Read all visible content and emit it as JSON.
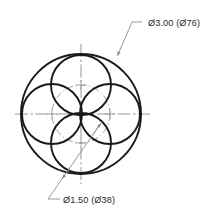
{
  "drawing": {
    "title": "Flower-petal circle pattern engineering detail",
    "type": "technical-drawing",
    "background_color": "#ffffff",
    "line_color": "#1a1a1a",
    "centerline_color": "#8a8a8a",
    "bolt_circle_color": "#9a9a9a",
    "leader_color": "#8c8c8c",
    "text_color": "#2b2b2b",
    "canvas": {
      "width": 209,
      "height": 217
    },
    "center": {
      "x": 81,
      "y": 114
    },
    "outer_circle": {
      "name": "outer-circle",
      "center_x": 81,
      "center_y": 114,
      "radius": 60,
      "diameter_inch": "3.00",
      "diameter_mm": "76"
    },
    "bolt_circle": {
      "name": "bolt-circle",
      "center_x": 81,
      "center_y": 114,
      "radius": 29,
      "style": "center-dashed"
    },
    "small_circles": {
      "count": 4,
      "radius": 30,
      "diameter_inch": "1.50",
      "diameter_mm": "38",
      "positions": [
        {
          "label": "top",
          "cx": 81,
          "cy": 85
        },
        {
          "label": "right",
          "cx": 110,
          "cy": 114
        },
        {
          "label": "bottom",
          "cx": 81,
          "cy": 143
        },
        {
          "label": "left",
          "cx": 52,
          "cy": 114
        }
      ]
    },
    "centerlines": {
      "horizontal": {
        "x1": 15,
        "y1": 114,
        "x2": 150,
        "y2": 114
      },
      "vertical": {
        "x1": 81,
        "y1": 44,
        "x2": 81,
        "y2": 184
      }
    },
    "center_marks": [
      {
        "cx": 81,
        "cy": 85
      },
      {
        "cx": 110,
        "cy": 114
      },
      {
        "cx": 81,
        "cy": 143
      },
      {
        "cx": 52,
        "cy": 114
      }
    ]
  },
  "annotations": {
    "outer_dimension": {
      "name": "outer-diameter-callout",
      "text": "Ø3.00 (Ø76)",
      "text_x": 148,
      "text_y": 26,
      "shoulder": {
        "x1": 142,
        "y1": 22,
        "x2": 132,
        "y2": 22
      },
      "leader": {
        "x1": 132,
        "y1": 22,
        "x2": 117,
        "y2": 56
      },
      "arrow_at": {
        "x": 116,
        "y": 58
      }
    },
    "hole_dimension": {
      "name": "hole-diameter-callout",
      "text": "Ø1.50 (Ø38)",
      "text_x": 63,
      "text_y": 203,
      "shoulder": {
        "x1": 60,
        "y1": 199,
        "x2": 48,
        "y2": 199
      },
      "leader": {
        "x1": 48,
        "y1": 199,
        "x2": 101,
        "y2": 123
      },
      "arrow_start": {
        "x": 63,
        "y": 179
      },
      "arrow_end": {
        "x": 101,
        "y": 123
      }
    }
  }
}
